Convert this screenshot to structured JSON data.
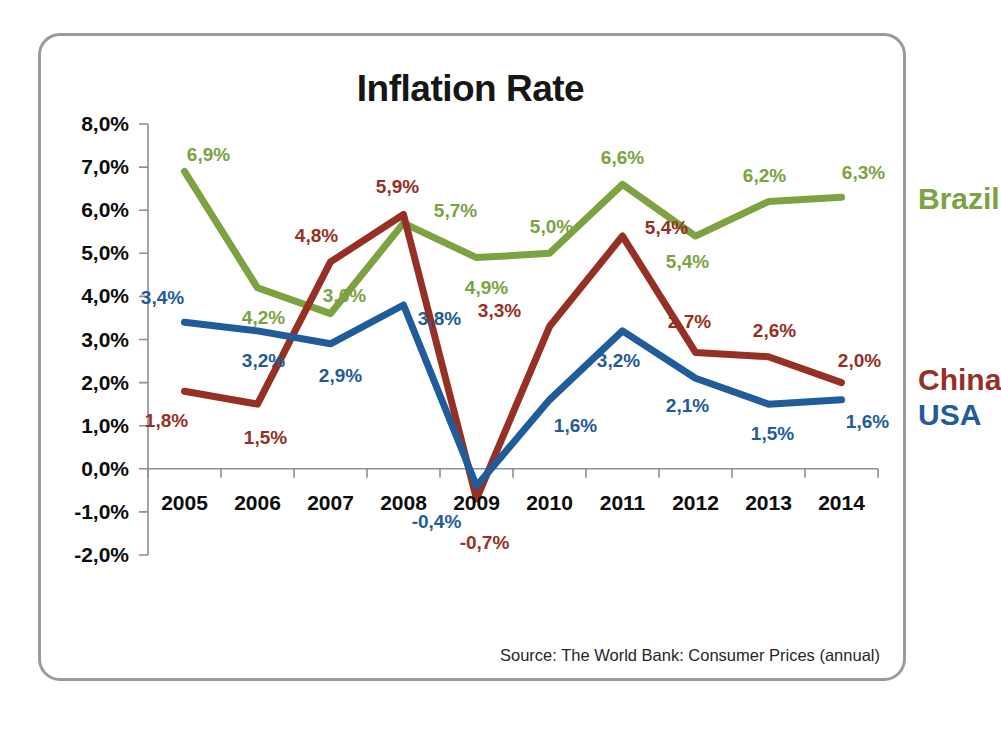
{
  "chart_data": {
    "type": "line",
    "title": "Inflation Rate",
    "source": "Source: The World Bank: Consumer Prices (annual)",
    "xlabel": "",
    "ylabel": "",
    "categories": [
      "2005",
      "2006",
      "2007",
      "2008",
      "2009",
      "2010",
      "2011",
      "2012",
      "2013",
      "2014"
    ],
    "ylim": [
      -2.0,
      8.0
    ],
    "ytick_labels": [
      "8,0%",
      "7,0%",
      "6,0%",
      "5,0%",
      "4,0%",
      "3,0%",
      "2,0%",
      "1,0%",
      "0,0%",
      "-1,0%",
      "-2,0%"
    ],
    "ytick_values": [
      8,
      7,
      6,
      5,
      4,
      3,
      2,
      1,
      0,
      -1,
      -2
    ],
    "grid": false,
    "legend_position": "right-inline",
    "series": [
      {
        "name": "Brazil",
        "color": "#7CA242",
        "values": [
          6.9,
          4.2,
          3.6,
          5.7,
          4.9,
          5.0,
          6.6,
          5.4,
          6.2,
          6.3
        ],
        "labels": [
          "6,9%",
          "4,2%",
          "3,6%",
          "5,7%",
          "4,9%",
          "5,0%",
          "6,6%",
          "5,4%",
          "6,2%",
          "6,3%"
        ]
      },
      {
        "name": "China",
        "color": "#963024",
        "values": [
          1.8,
          1.5,
          4.8,
          5.9,
          -0.7,
          3.3,
          5.4,
          2.7,
          2.6,
          2.0
        ],
        "labels": [
          "1,8%",
          "1,5%",
          "4,8%",
          "5,9%",
          "-0,7%",
          "3,3%",
          "5,4%",
          "2,7%",
          "2,6%",
          "2,0%"
        ]
      },
      {
        "name": "USA",
        "color": "#1F5C99",
        "values": [
          3.4,
          3.2,
          2.9,
          3.8,
          -0.4,
          1.6,
          3.2,
          2.1,
          1.5,
          1.6
        ],
        "labels": [
          "3,4%",
          "3,2%",
          "2,9%",
          "3,8%",
          "-0,4%",
          "1,6%",
          "3,2%",
          "2,1%",
          "1,5%",
          "1,6%"
        ]
      }
    ],
    "label_offsets": {
      "Brazil": [
        [
          24,
          -16
        ],
        [
          6,
          30
        ],
        [
          14,
          -18
        ],
        [
          52,
          -12
        ],
        [
          10,
          30
        ],
        [
          2,
          -26
        ],
        [
          0,
          -26
        ],
        [
          -8,
          26
        ],
        [
          -4,
          -26
        ],
        [
          22,
          -24
        ]
      ],
      "China": [
        [
          -18,
          30
        ],
        [
          8,
          34
        ],
        [
          -14,
          -26
        ],
        [
          -6,
          -28
        ],
        [
          8,
          44
        ],
        [
          -50,
          -16
        ],
        [
          44,
          -8
        ],
        [
          -6,
          -30
        ],
        [
          6,
          -26
        ],
        [
          18,
          -22
        ]
      ],
      "USA": [
        [
          -22,
          -24
        ],
        [
          6,
          30
        ],
        [
          10,
          32
        ],
        [
          36,
          14
        ],
        [
          -40,
          36
        ],
        [
          26,
          26
        ],
        [
          -4,
          30
        ],
        [
          -8,
          28
        ],
        [
          4,
          30
        ],
        [
          26,
          22
        ]
      ]
    },
    "series_name_positions": {
      "Brazil": {
        "x": 770,
        "y": 6.25
      },
      "China": {
        "x": 770,
        "y": 2.05
      },
      "USA": {
        "x": 770,
        "y": 1.25
      }
    }
  }
}
